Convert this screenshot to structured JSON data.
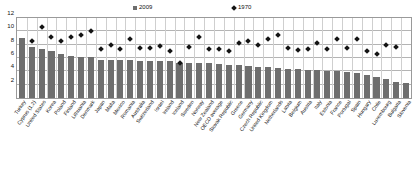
{
  "chart_data": {
    "type": "bar",
    "title": "",
    "subtitle": "",
    "xlabel": "",
    "ylabel": "",
    "ylim": [
      0,
      12
    ],
    "yticks": [
      0,
      2,
      4,
      6,
      8,
      10,
      12
    ],
    "ytick_labels": [
      "",
      "2",
      "4",
      "6",
      "8",
      "10",
      "12"
    ],
    "grid": true,
    "legend_position": "top",
    "legend": [
      {
        "name": "2009",
        "marker": "square",
        "color": "#6e6e6e"
      },
      {
        "name": "1970",
        "marker": "diamond",
        "color": "#141414"
      }
    ],
    "categories": [
      "Turkey",
      "Cyprus (1,2)",
      "United States",
      "Korea",
      "Poland",
      "Finland",
      "Lithuania",
      "Denmark",
      "Japan",
      "Malta",
      "Mexico",
      "Romania",
      "Australia",
      "Switzerland",
      "Israel",
      "Ireland",
      "Iceland",
      "Sweden",
      "Norway",
      "New Zealand",
      "OECD average",
      "Slovak Republic",
      "Greece",
      "Germany",
      "Czech Republic",
      "United Kingdom",
      "Netherlands",
      "Latvia",
      "Belgium",
      "Austria",
      "Italy",
      "Estonia",
      "France",
      "Portugal",
      "Spain",
      "Hungary",
      "Chile",
      "Luxembourg",
      "Bulgaria",
      "Slovenia"
    ],
    "series": [
      {
        "name": "2009",
        "type": "bar",
        "color": "#6e6e6e",
        "values": [
          9.0,
          7.7,
          7.3,
          7.1,
          6.6,
          6.3,
          6.1,
          6.1,
          5.7,
          5.7,
          5.7,
          5.7,
          5.6,
          5.6,
          5.6,
          5.5,
          5.2,
          5.2,
          5.2,
          5.3,
          5.1,
          5.0,
          4.9,
          4.8,
          4.7,
          4.6,
          4.5,
          4.4,
          4.3,
          4.2,
          4.2,
          4.1,
          4.0,
          3.9,
          3.7,
          3.5,
          3.2,
          2.8,
          2.4,
          2.2
        ]
      },
      {
        "name": "1970",
        "type": "scatter",
        "color": "#141414",
        "values": [
          null,
          8.5,
          10.6,
          9.2,
          8.6,
          9.1,
          9.5,
          10.0,
          7.4,
          7.9,
          7.3,
          8.8,
          7.5,
          7.5,
          7.8,
          7.0,
          5.3,
          7.6,
          9.1,
          7.4,
          7.3,
          7.0,
          8.2,
          8.5,
          7.9,
          8.9,
          9.4,
          7.5,
          7.2,
          7.3,
          8.3,
          7.3,
          8.8,
          7.5,
          8.8,
          7.0,
          6.6,
          7.9,
          7.7,
          0.0
        ]
      }
    ]
  }
}
